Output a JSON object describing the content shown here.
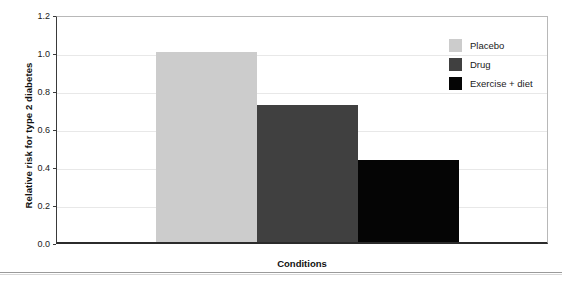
{
  "chart_data": {
    "type": "bar",
    "title": "",
    "xlabel": "Conditions",
    "ylabel": "Relative risk for type 2 diabetes",
    "categories": [
      "Placebo",
      "Drug",
      "Exercise + diet"
    ],
    "values": [
      1.0,
      0.72,
      0.43
    ],
    "series": [
      {
        "name": "Relative risk for type 2 diabetes",
        "values": [
          1.0,
          0.72,
          0.43
        ]
      }
    ],
    "ylim": [
      0.0,
      1.2
    ],
    "xlim": [
      0,
      1
    ],
    "ytick_labels": [
      "0.0",
      "0.2",
      "0.4",
      "0.6",
      "0.8",
      "1.0",
      "1.2"
    ],
    "ytick_values": [
      0.0,
      0.2,
      0.4,
      0.6,
      0.8,
      1.0,
      1.2
    ],
    "xtick_labels": [],
    "grid": "horizontal",
    "legend_position": "top-right",
    "colors": {
      "placebo": "#cccccc",
      "drug": "#404040",
      "exercise_diet": "#050505",
      "gridline": "#e8e8e8",
      "axis": "#2b2b2b",
      "plot_background": "#ffffff"
    },
    "legend": [
      {
        "label": "Placebo",
        "color": "#cccccc"
      },
      {
        "label": "Drug",
        "color": "#404040"
      },
      {
        "label": "Exercise + diet",
        "color": "#050505"
      }
    ]
  }
}
